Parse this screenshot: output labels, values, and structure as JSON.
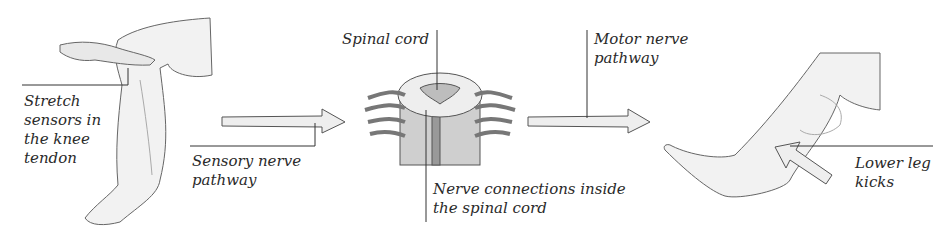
{
  "diagram": {
    "type": "knee-jerk reflex pathway",
    "stages": [
      {
        "id": "stimulus",
        "label": "Stretch sensors in the knee tendon"
      },
      {
        "id": "sensory",
        "label": "Sensory nerve pathway"
      },
      {
        "id": "spinal",
        "label": "Spinal cord"
      },
      {
        "id": "connections",
        "label": "Nerve connections inside the spinal cord"
      },
      {
        "id": "motor",
        "label": "Motor nerve pathway"
      },
      {
        "id": "response",
        "label": "Lower leg kicks"
      }
    ]
  },
  "labels": {
    "stretch": [
      "Stretch",
      "sensors in",
      "the knee",
      "tendon"
    ],
    "sensory": [
      "Sensory nerve",
      "pathway"
    ],
    "spinal_cord": "Spinal cord",
    "connections": [
      "Nerve connections inside",
      "the spinal cord"
    ],
    "motor": [
      "Motor nerve",
      "pathway"
    ],
    "lower_leg": [
      "Lower leg",
      "kicks"
    ]
  },
  "colors": {
    "line": "#333333",
    "arrow_fill": "#eeeeee",
    "skin": "#f2f2f2",
    "skin_shade": "#d8d8d8",
    "cord_shade": "#bdbdbd"
  }
}
